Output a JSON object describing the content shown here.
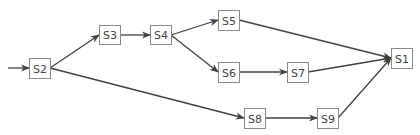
{
  "diagram": {
    "type": "directed-flow",
    "colors": {
      "edge": "#404040",
      "node_border": "#8a8a8a",
      "node_text": "#444444",
      "background": "#ffffff"
    },
    "nodes": [
      {
        "id": "S2",
        "label": "S2",
        "x": 29,
        "y": 58,
        "w": 21,
        "h": 20
      },
      {
        "id": "S3",
        "label": "S3",
        "x": 99,
        "y": 25,
        "w": 21,
        "h": 19
      },
      {
        "id": "S4",
        "label": "S4",
        "x": 150,
        "y": 25,
        "w": 21,
        "h": 19
      },
      {
        "id": "S5",
        "label": "S5",
        "x": 218,
        "y": 10,
        "w": 21,
        "h": 20
      },
      {
        "id": "S6",
        "label": "S6",
        "x": 218,
        "y": 62,
        "w": 21,
        "h": 20
      },
      {
        "id": "S7",
        "label": "S7",
        "x": 287,
        "y": 62,
        "w": 21,
        "h": 20
      },
      {
        "id": "S8",
        "label": "S8",
        "x": 244,
        "y": 108,
        "w": 21,
        "h": 20
      },
      {
        "id": "S9",
        "label": "S9",
        "x": 317,
        "y": 108,
        "w": 21,
        "h": 20
      },
      {
        "id": "S1",
        "label": "S1",
        "x": 391,
        "y": 48,
        "w": 21,
        "h": 20
      }
    ],
    "edges": [
      {
        "from": "entry",
        "to": "S2",
        "x1": 8,
        "y1": 68,
        "x2": 29,
        "y2": 68
      },
      {
        "from": "S2",
        "to": "S3",
        "x1": 50,
        "y1": 68,
        "x2": 99,
        "y2": 35
      },
      {
        "from": "S2",
        "to": "S8",
        "x1": 50,
        "y1": 68,
        "x2": 244,
        "y2": 118
      },
      {
        "from": "S3",
        "to": "S4",
        "x1": 120,
        "y1": 35,
        "x2": 150,
        "y2": 35
      },
      {
        "from": "S4",
        "to": "S5",
        "x1": 171,
        "y1": 35,
        "x2": 218,
        "y2": 20
      },
      {
        "from": "S4",
        "to": "S6",
        "x1": 171,
        "y1": 35,
        "x2": 218,
        "y2": 72
      },
      {
        "from": "S6",
        "to": "S7",
        "x1": 239,
        "y1": 72,
        "x2": 287,
        "y2": 72
      },
      {
        "from": "S8",
        "to": "S9",
        "x1": 265,
        "y1": 118,
        "x2": 317,
        "y2": 118
      },
      {
        "from": "S5",
        "to": "S1",
        "x1": 239,
        "y1": 20,
        "x2": 391,
        "y2": 58
      },
      {
        "from": "S7",
        "to": "S1",
        "x1": 308,
        "y1": 72,
        "x2": 391,
        "y2": 58
      },
      {
        "from": "S9",
        "to": "S1",
        "x1": 338,
        "y1": 118,
        "x2": 391,
        "y2": 58
      }
    ]
  }
}
